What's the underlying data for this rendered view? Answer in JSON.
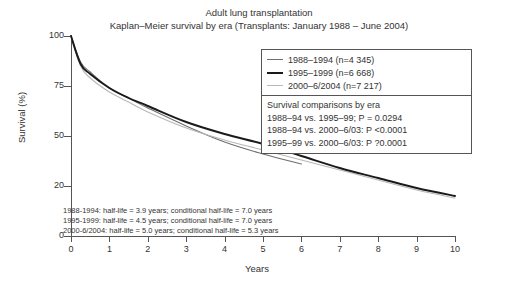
{
  "title": {
    "line1": "Adult lung transplantation",
    "line2": "Kaplan–Meier survival by era (Transplants: January 1988 – June 2004)"
  },
  "axes": {
    "ylabel": "Survival (%)",
    "xlabel": "Years",
    "yticks": [
      "100",
      "75",
      "50",
      "20",
      "0"
    ],
    "xticks": [
      "0",
      "1",
      "2",
      "3",
      "4",
      "5",
      "6",
      "7",
      "8",
      "9",
      "10"
    ]
  },
  "legend": {
    "entries": [
      {
        "label": "1988–1994 (n=4 345)",
        "color": "#6e6e6e",
        "width": "1.4"
      },
      {
        "label": "1995–1999 (n=6 668)",
        "color": "#1a1a1a",
        "width": "2.2"
      },
      {
        "label": "2000–6/2004 (n=7 217)",
        "color": "#b8b8b8",
        "width": "1.4"
      }
    ],
    "comparisons_heading": "Survival comparisons by era",
    "comparisons": [
      "1988–94 vs. 1995–99; P = 0.0294",
      "1988–94 vs. 2000–6/03: P <0.0001",
      "1995–99 vs. 2000–6/03: P ?0.0001"
    ]
  },
  "annotations": {
    "halflife": [
      "1988-1994: half-life = 3.9 years; conditional half-life = 7.0 years",
      "1995-1999: half-life = 4.5 years; conditional half-life = 7.0 years",
      "2000-6/2004: half-life = 5.0 years; conditional half-life = 5.3 years"
    ]
  },
  "chart_data": {
    "type": "line",
    "xlabel": "Years",
    "ylabel": "Survival (%)",
    "xlim": [
      0,
      10
    ],
    "ylim": [
      0,
      100
    ],
    "grid": false,
    "legend_position": "upper-right",
    "x": [
      0,
      0.25,
      0.5,
      1,
      1.5,
      2,
      3,
      4,
      5,
      6,
      7,
      8,
      9,
      10
    ],
    "series": [
      {
        "name": "1988–1994 (n=4 345)",
        "n": 4345,
        "color": "#6e6e6e",
        "half_life_years": 3.9,
        "conditional_half_life_years": 7.0,
        "values": [
          100,
          87,
          82,
          74,
          69,
          64,
          55,
          47,
          41,
          36,
          null,
          null,
          null,
          null
        ]
      },
      {
        "name": "1995–1999 (n=6 668)",
        "n": 6668,
        "color": "#1a1a1a",
        "half_life_years": 4.5,
        "conditional_half_life_years": 7.0,
        "values": [
          100,
          86,
          81,
          74,
          69,
          65,
          57,
          51,
          46,
          40,
          34,
          29,
          24,
          20
        ]
      },
      {
        "name": "2000–6/2004 (n=7 217)",
        "n": 7217,
        "color": "#b8b8b8",
        "half_life_years": 5.0,
        "conditional_half_life_years": 5.3,
        "values": [
          100,
          85,
          79,
          72,
          67,
          62,
          54,
          48,
          43,
          38,
          33,
          28,
          23,
          19
        ]
      }
    ],
    "annotations": [
      "1988-1994: half-life = 3.9 years; conditional half-life = 7.0 years",
      "1995-1999: half-life = 4.5 years; conditional half-life = 7.0 years",
      "2000-6/2004: half-life = 5.0 years; conditional half-life = 5.3 years",
      "1988–94 vs. 1995–99; P = 0.0294",
      "1988–94 vs. 2000–6/03: P <0.0001",
      "1995–99 vs. 2000–6/03: P ?0.0001"
    ]
  }
}
